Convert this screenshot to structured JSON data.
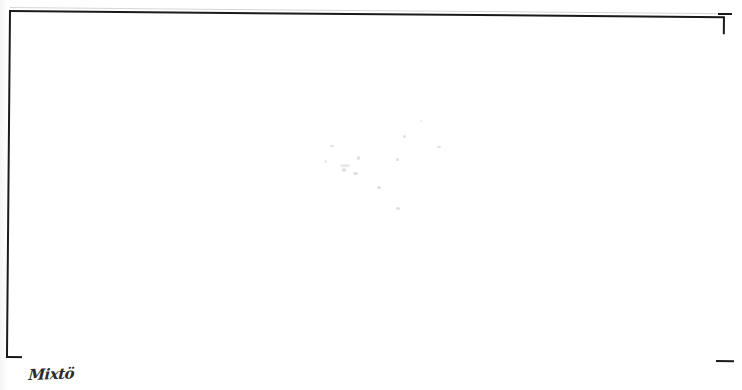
{
  "page": {
    "kind": "scanned-document-page",
    "background_color": "#ffffff",
    "width": 742,
    "height": 390
  },
  "frame": {
    "name": "empty-bordered-box",
    "description": "Large empty rectangular ruled border occupying most of the page",
    "border_color": "#1a1a1a",
    "fill_color": "#ffffff",
    "rotation_degrees": 0.5,
    "content": ""
  },
  "artifacts": {
    "label": "faint scanner show-through specks",
    "color": "#aaaab9"
  },
  "annotation": {
    "handwritten_text": "Mixtö",
    "color": "#2b2b2b",
    "position": "below-bottom-left-corner"
  }
}
